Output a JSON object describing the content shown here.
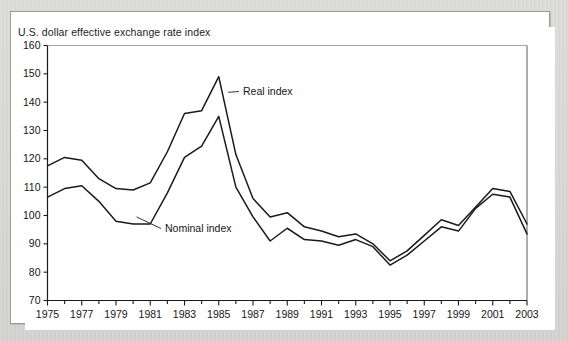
{
  "figure": {
    "title": "U.S. dollar effective exchange rate index",
    "background_color": "#ffffff",
    "page_color": "#d6d6d4",
    "border_color": "#9a9a98",
    "line_color": "#1a1a1a"
  },
  "annotations": {
    "real": "Real index",
    "nominal": "Nominal index"
  },
  "chart_data": {
    "type": "line",
    "title": "U.S. dollar effective exchange rate index",
    "xlabel": "",
    "ylabel": "",
    "xlim": [
      1975,
      2003
    ],
    "ylim": [
      70,
      160
    ],
    "grid": false,
    "legend_position": "inline-annotation",
    "yticks": [
      70,
      80,
      90,
      100,
      110,
      120,
      130,
      140,
      150,
      160
    ],
    "ytick_labels": [
      "70",
      "80",
      "90",
      "100",
      "110",
      "120",
      "130",
      "140",
      "150",
      "160"
    ],
    "xticks": [
      1975,
      1976,
      1977,
      1978,
      1979,
      1980,
      1981,
      1982,
      1983,
      1984,
      1985,
      1986,
      1987,
      1988,
      1989,
      1990,
      1991,
      1992,
      1993,
      1994,
      1995,
      1996,
      1997,
      1998,
      1999,
      2000,
      2001,
      2002,
      2003
    ],
    "xtick_labels": [
      "1975",
      "",
      "1977",
      "",
      "1979",
      "",
      "1981",
      "",
      "1983",
      "",
      "1985",
      "",
      "1987",
      "",
      "1989",
      "",
      "1991",
      "",
      "1993",
      "",
      "1995",
      "",
      "1997",
      "",
      "1999",
      "",
      "2001",
      "",
      "2003"
    ],
    "x": [
      1975,
      1976,
      1977,
      1978,
      1979,
      1980,
      1981,
      1982,
      1983,
      1984,
      1985,
      1986,
      1987,
      1988,
      1989,
      1990,
      1991,
      1992,
      1993,
      1994,
      1995,
      1996,
      1997,
      1998,
      1999,
      2000,
      2001,
      2002,
      2003
    ],
    "series": [
      {
        "name": "Real index",
        "values": [
          117.5,
          120.5,
          119.5,
          113.0,
          109.5,
          109.0,
          111.5,
          122.5,
          136.0,
          137.0,
          149.0,
          121.5,
          106.0,
          99.5,
          101.0,
          96.0,
          94.5,
          92.5,
          93.5,
          90.0,
          84.0,
          87.5,
          93.0,
          98.5,
          96.5,
          103.0,
          109.5,
          108.5,
          97.0
        ]
      },
      {
        "name": "Nominal index",
        "values": [
          106.5,
          109.5,
          110.5,
          105.0,
          98.0,
          97.0,
          97.0,
          108.0,
          120.5,
          124.5,
          135.0,
          110.0,
          99.5,
          91.0,
          95.5,
          91.5,
          91.0,
          89.5,
          91.5,
          89.0,
          82.5,
          86.0,
          91.0,
          96.0,
          94.5,
          102.5,
          107.5,
          106.5,
          93.5
        ]
      }
    ]
  }
}
